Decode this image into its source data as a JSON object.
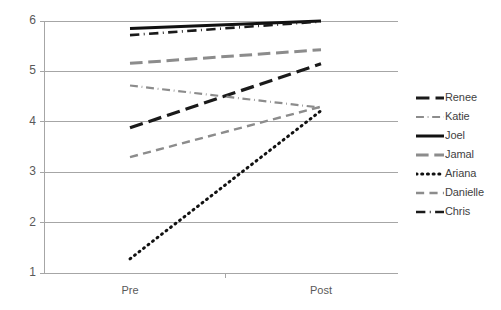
{
  "chart_data": {
    "type": "line",
    "title": "",
    "subtitle": "",
    "xlabel": "",
    "ylabel": "",
    "categories": [
      "Pre",
      "Post"
    ],
    "x": [
      0,
      1
    ],
    "ylim": [
      1,
      6
    ],
    "yticks": [
      1,
      2,
      3,
      4,
      5,
      6
    ],
    "ytick_labels": [
      "1",
      "2",
      "3",
      "4",
      "5",
      "6"
    ],
    "xtick_labels": [
      "Pre",
      "Post"
    ],
    "grid": "horizontal",
    "legend_position": "right",
    "background": "#ffffff",
    "gridline_color": "#a6a6a6",
    "axis_color": "#a6a6a6",
    "series": [
      {
        "name": "Renee",
        "values": [
          3.88,
          5.15
        ],
        "color": "#1a1a1a",
        "dash": "long-dash",
        "width": 3.2
      },
      {
        "name": "Katie",
        "values": [
          4.72,
          4.28
        ],
        "color": "#8c8c8c",
        "dash": "dash-dot",
        "width": 2.2
      },
      {
        "name": "Joel",
        "values": [
          5.85,
          6.0
        ],
        "color": "#111111",
        "dash": "solid",
        "width": 3.0
      },
      {
        "name": "Jamal",
        "values": [
          5.16,
          5.43
        ],
        "color": "#8c8c8c",
        "dash": "long-dash",
        "width": 3.0
      },
      {
        "name": "Ariana",
        "values": [
          1.28,
          4.22
        ],
        "color": "#111111",
        "dash": "dot",
        "width": 3.0
      },
      {
        "name": "Danielle",
        "values": [
          3.3,
          4.3
        ],
        "color": "#8c8c8c",
        "dash": "medium-dash",
        "width": 2.4
      },
      {
        "name": "Chris",
        "values": [
          5.72,
          5.99
        ],
        "color": "#1a1a1a",
        "dash": "dash-dot",
        "width": 2.6
      }
    ]
  },
  "legend": {
    "items": [
      {
        "label": "Renee"
      },
      {
        "label": "Katie"
      },
      {
        "label": "Joel"
      },
      {
        "label": "Jamal"
      },
      {
        "label": "Ariana"
      },
      {
        "label": "Danielle"
      },
      {
        "label": "Chris"
      }
    ]
  },
  "axes": {
    "y_labels": [
      "6",
      "5",
      "4",
      "3",
      "2",
      "1"
    ],
    "x_labels": [
      "Pre",
      "Post"
    ]
  }
}
